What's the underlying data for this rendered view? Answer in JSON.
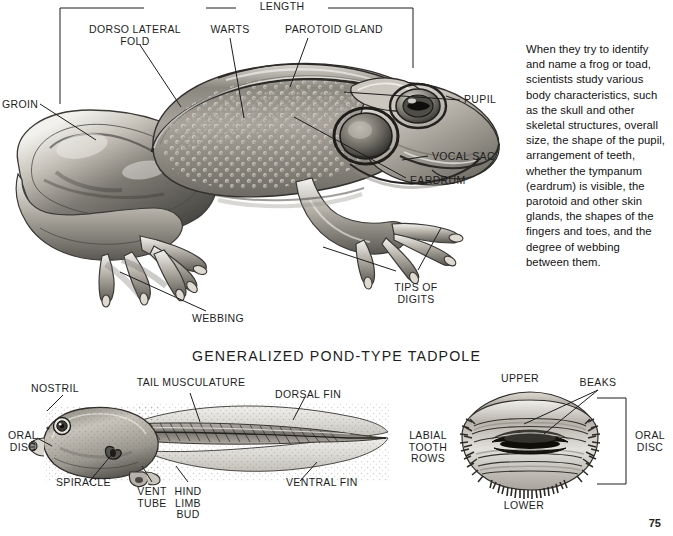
{
  "page": {
    "folio": "75",
    "background": "#ffffff",
    "ink": "#1d1d1d"
  },
  "figures": {
    "frog": {
      "name": "frog-lateral-view",
      "bracket_label": "LENGTH",
      "labels": [
        {
          "id": "dorso-lateral-fold",
          "text": "DORSO LATERAL\nFOLD"
        },
        {
          "id": "warts",
          "text": "WARTS"
        },
        {
          "id": "parotoid-gland",
          "text": "PAROTOID GLAND"
        },
        {
          "id": "groin",
          "text": "GROIN"
        },
        {
          "id": "pupil",
          "text": "PUPIL"
        },
        {
          "id": "vocal-sac",
          "text": "VOCAL SAC"
        },
        {
          "id": "eardrum",
          "text": "EARDRUM"
        },
        {
          "id": "tips-of-digits",
          "text": "TIPS OF\nDIGITS"
        },
        {
          "id": "webbing",
          "text": "WEBBING"
        }
      ]
    },
    "tadpole": {
      "heading": "GENERALIZED POND-TYPE TADPOLE",
      "labels": [
        {
          "id": "nostril",
          "text": "NOSTRIL"
        },
        {
          "id": "oral-disc",
          "text": "ORAL\nDISC"
        },
        {
          "id": "spiracle",
          "text": "SPIRACLE"
        },
        {
          "id": "tail-musculature",
          "text": "TAIL MUSCULATURE"
        },
        {
          "id": "dorsal-fin",
          "text": "DORSAL FIN"
        },
        {
          "id": "vent-tube",
          "text": "VENT\nTUBE"
        },
        {
          "id": "hind-limb-bud",
          "text": "HIND\nLIMB\nBUD"
        },
        {
          "id": "ventral-fin",
          "text": "VENTRAL FIN"
        }
      ]
    },
    "oral_disc": {
      "name": "tadpole-oral-disc-detail",
      "labels": [
        {
          "id": "upper",
          "text": "UPPER"
        },
        {
          "id": "beaks",
          "text": "BEAKS"
        },
        {
          "id": "labial-tooth-rows",
          "text": "LABIAL\nTOOTH\nROWS"
        },
        {
          "id": "oral-disc-bracket",
          "text": "ORAL\nDISC"
        },
        {
          "id": "lower",
          "text": "LOWER"
        }
      ]
    }
  },
  "sidebar_text": {
    "paragraph": "When they try to identify and name a frog or toad, scientists study various body characteristics, such as the skull and other skeletal structures, overall size, the shape of the pupil, arrangement of teeth, whether the tympanum (eardrum) is visible, the parotoid and other skin glands, the shapes of the fingers and toes, and the degree of webbing between them."
  }
}
